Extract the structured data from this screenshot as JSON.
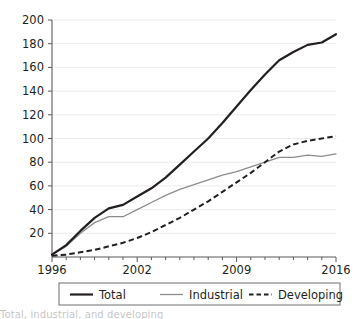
{
  "chart_data": {
    "type": "line",
    "title": "",
    "subtitle": "",
    "xlabel": "",
    "ylabel": "",
    "xlim": [
      1996,
      2016
    ],
    "ylim": [
      0,
      200
    ],
    "grid": true,
    "grid_axis": "y",
    "legend_position": "bottom",
    "x": [
      1996,
      1997,
      1998,
      1999,
      2000,
      2001,
      2002,
      2003,
      2004,
      2005,
      2006,
      2007,
      2008,
      2009,
      2010,
      2011,
      2012,
      2013,
      2014,
      2015,
      2016
    ],
    "x_tick_labels": [
      "1996",
      "2002",
      "2009",
      "2016"
    ],
    "x_tick_values": [
      1996,
      2002,
      2009,
      2016
    ],
    "x_minor_ticks": [
      1996,
      1997,
      1998,
      1999,
      2000,
      2001,
      2002,
      2003,
      2004,
      2005,
      2006,
      2007,
      2008,
      2009,
      2010,
      2011,
      2012,
      2013,
      2014,
      2015,
      2016
    ],
    "y_tick_labels": [
      "20",
      "40",
      "60",
      "80",
      "100",
      "120",
      "140",
      "160",
      "180",
      "200"
    ],
    "y_tick_values": [
      20,
      40,
      60,
      80,
      100,
      120,
      140,
      160,
      180,
      200
    ],
    "series": [
      {
        "name": "Total",
        "style": "solid-thick",
        "color": "#231f20",
        "values": [
          2,
          10,
          22,
          33,
          41,
          44,
          51,
          58,
          67,
          78,
          89,
          100,
          113,
          127,
          141,
          154,
          166,
          173,
          179,
          181,
          188
        ]
      },
      {
        "name": "Industrial",
        "style": "solid-thin",
        "color": "#8c8c8c",
        "values": [
          2,
          9,
          20,
          29,
          34,
          34,
          40,
          46,
          52,
          57,
          61,
          65,
          69,
          72,
          76,
          80,
          84,
          84,
          86,
          85,
          87
        ]
      },
      {
        "name": "Developing",
        "style": "dashed",
        "color": "#231f20",
        "values": [
          1,
          2,
          4,
          6,
          9,
          12,
          16,
          21,
          27,
          33,
          40,
          47,
          55,
          63,
          71,
          80,
          89,
          95,
          98,
          100,
          102
        ]
      }
    ]
  },
  "legend": {
    "entries": [
      {
        "label": "Total",
        "icon": "line-solid-thick-icon"
      },
      {
        "label": "Industrial",
        "icon": "line-solid-thin-icon"
      },
      {
        "label": "Developing",
        "icon": "line-dashed-icon"
      }
    ]
  },
  "caption": {
    "text": "Total, industrial, and developing"
  },
  "colors": {
    "total": "#231f20",
    "industrial": "#8c8c8c",
    "developing": "#231f20",
    "grid": "#e6e6e6",
    "axis": "#58595b",
    "background": "#ffffff"
  }
}
